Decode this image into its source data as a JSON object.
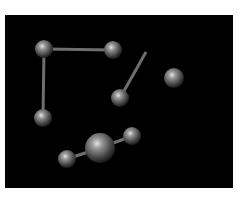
{
  "scene": {
    "background": "#000000",
    "bond_color": "#6e6e6e",
    "atom_color_light": "#d8d8d8",
    "atom_color_dark": "#3a3a3a",
    "atoms": [
      {
        "id": "a1",
        "cx": 44,
        "cy": 49,
        "r": 9
      },
      {
        "id": "a2",
        "cx": 113,
        "cy": 50,
        "r": 9
      },
      {
        "id": "a3",
        "cx": 43,
        "cy": 118,
        "r": 9
      },
      {
        "id": "a4",
        "cx": 120,
        "cy": 98,
        "r": 9
      },
      {
        "id": "a5",
        "cx": 174,
        "cy": 78,
        "r": 10
      },
      {
        "id": "a6",
        "cx": 100,
        "cy": 148,
        "r": 15
      },
      {
        "id": "a7",
        "cx": 132,
        "cy": 136,
        "r": 9
      },
      {
        "id": "a8",
        "cx": 67,
        "cy": 159,
        "r": 9
      }
    ],
    "bonds": [
      {
        "x1": 44,
        "y1": 49,
        "x2": 113,
        "y2": 50
      },
      {
        "x1": 44,
        "y1": 49,
        "x2": 43,
        "y2": 118
      },
      {
        "x1": 120,
        "y1": 98,
        "x2": 146,
        "y2": 52
      },
      {
        "x1": 100,
        "y1": 148,
        "x2": 132,
        "y2": 136
      },
      {
        "x1": 100,
        "y1": 148,
        "x2": 67,
        "y2": 159
      }
    ]
  }
}
